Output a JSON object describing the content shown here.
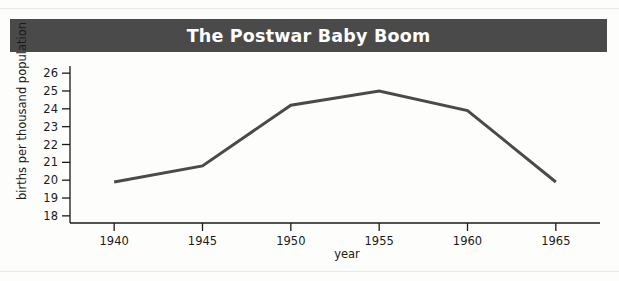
{
  "figure": {
    "title": "The Postwar Baby Boom",
    "title_bar_color": "#4a4a4a",
    "title_text_color": "#ffffff",
    "background_color": "#fdfdfc"
  },
  "chart_data": {
    "type": "line",
    "title": "The Postwar Baby Boom",
    "xlabel": "year",
    "ylabel": "births per thousand population",
    "x": [
      1940,
      1945,
      1950,
      1955,
      1960,
      1965
    ],
    "values": [
      19.9,
      20.8,
      24.2,
      25.0,
      23.9,
      19.9
    ],
    "xtick_labels": [
      "1940",
      "1945",
      "1950",
      "1955",
      "1960",
      "1965"
    ],
    "ytick_labels": [
      "18",
      "19",
      "20",
      "21",
      "22",
      "23",
      "24",
      "25",
      "26"
    ],
    "yticks": [
      18,
      19,
      20,
      21,
      22,
      23,
      24,
      25,
      26
    ],
    "xlim": [
      1937.5,
      1967.5
    ],
    "ylim": [
      17.6,
      26.4
    ],
    "grid": false,
    "legend": false,
    "line_color": "#4a4a4a",
    "line_width": 3,
    "markers": false
  },
  "axes": {
    "y_axis_label": "births per thousand population",
    "x_axis_label": "year"
  }
}
